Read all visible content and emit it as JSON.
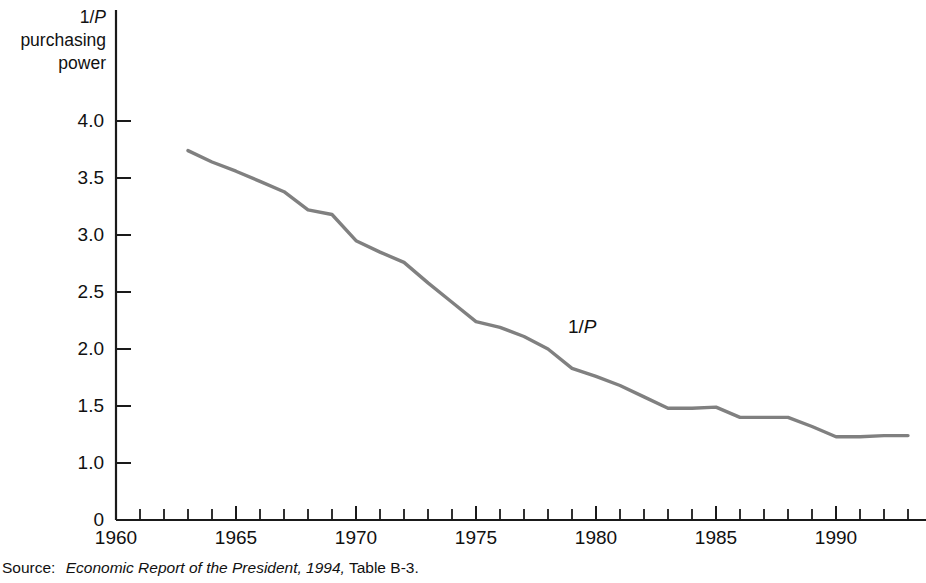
{
  "figure": {
    "y_axis_title_lines": [
      "1/P",
      "purchasing",
      "power"
    ],
    "y_axis_title_italic_part": "P",
    "series_annotation": "1/P",
    "source_prefix": "Source:",
    "source_title_italic": "Economic Report of the President, 1994,",
    "source_suffix": "Table B-3.",
    "line_color": "#808080",
    "axis_color": "#1a1a1a",
    "background_color": "#ffffff"
  },
  "chart_data": {
    "type": "line",
    "title": "",
    "xlabel": "",
    "ylabel": "1/P purchasing power",
    "xlim": [
      1960,
      1993
    ],
    "ylim": [
      0,
      4.25
    ],
    "grid": false,
    "legend": "inline-label",
    "y_ticks": [
      {
        "value": 4.0,
        "label": "4.0"
      },
      {
        "value": 3.5,
        "label": "3.5"
      },
      {
        "value": 3.0,
        "label": "3.0"
      },
      {
        "value": 2.5,
        "label": "2.5"
      },
      {
        "value": 2.0,
        "label": "2.0"
      },
      {
        "value": 1.5,
        "label": "1.5"
      },
      {
        "value": 1.0,
        "label": "1.0"
      },
      {
        "value": 0.0,
        "label": "0"
      }
    ],
    "x_ticks_major": [
      {
        "value": 1960,
        "label": "1960"
      },
      {
        "value": 1965,
        "label": "1965"
      },
      {
        "value": 1970,
        "label": "1970"
      },
      {
        "value": 1975,
        "label": "1975"
      },
      {
        "value": 1980,
        "label": "1980"
      },
      {
        "value": 1985,
        "label": "1985"
      },
      {
        "value": 1990,
        "label": "1990"
      }
    ],
    "x_ticks_minor_step": 1,
    "x_minor_range": [
      1960,
      1993
    ],
    "series": [
      {
        "name": "1/P",
        "x": [
          1963,
          1964,
          1965,
          1966,
          1967,
          1968,
          1969,
          1970,
          1971,
          1972,
          1973,
          1974,
          1975,
          1976,
          1977,
          1978,
          1979,
          1980,
          1981,
          1982,
          1983,
          1984,
          1985,
          1986,
          1987,
          1988,
          1989,
          1990,
          1991,
          1992,
          1993
        ],
        "values": [
          3.74,
          3.64,
          3.56,
          3.47,
          3.38,
          3.22,
          3.18,
          2.95,
          2.85,
          2.76,
          2.58,
          2.41,
          2.24,
          2.19,
          2.11,
          2.0,
          1.83,
          1.76,
          1.68,
          1.58,
          1.48,
          1.48,
          1.49,
          1.4,
          1.4,
          1.4,
          1.32,
          1.23,
          1.23,
          1.24,
          1.24
        ]
      }
    ]
  }
}
